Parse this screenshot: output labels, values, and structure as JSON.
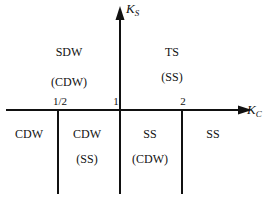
{
  "diagram": {
    "axes": {
      "x": {
        "label": "K",
        "subscript": "C"
      },
      "y": {
        "label": "K",
        "subscript": "S"
      }
    },
    "ticks": [
      "1/2",
      "1",
      "2"
    ],
    "regions": {
      "upper_left": {
        "main": "SDW",
        "sub": "(CDW)"
      },
      "upper_right": {
        "main": "TS",
        "sub": "(SS)"
      },
      "lower_1": {
        "main": "CDW"
      },
      "lower_2": {
        "main": "CDW",
        "sub": "(SS)"
      },
      "lower_3": {
        "main": "SS",
        "sub": "(CDW)"
      },
      "lower_4": {
        "main": "SS"
      }
    },
    "colors": {
      "line": "#111111",
      "background": "#ffffff"
    }
  }
}
